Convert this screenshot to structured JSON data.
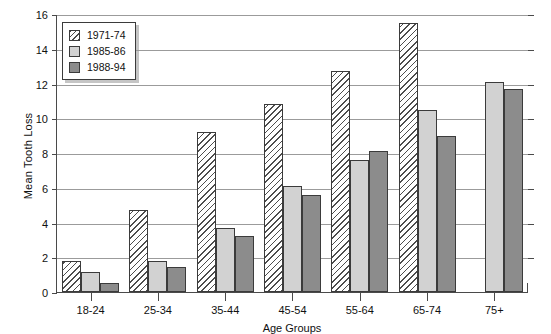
{
  "chart_data": {
    "type": "bar",
    "title": "",
    "xlabel": "Age Groups",
    "ylabel": "Mean Tooth Loss",
    "categories": [
      "18-24",
      "25-34",
      "35-44",
      "45-54",
      "55-64",
      "65-74",
      "75+"
    ],
    "series": [
      {
        "name": "1971-74",
        "color": "#ffffff",
        "pattern": "diagonal-hatch",
        "values": [
          1.8,
          4.7,
          9.2,
          10.8,
          12.7,
          15.5,
          null
        ]
      },
      {
        "name": "1985-86",
        "color": "#d2d2d2",
        "pattern": "solid",
        "values": [
          1.15,
          1.8,
          3.7,
          6.1,
          7.6,
          10.5,
          12.1
        ]
      },
      {
        "name": "1988-94",
        "color": "#8c8c8c",
        "pattern": "solid",
        "values": [
          0.5,
          1.45,
          3.25,
          5.6,
          8.1,
          9.0,
          11.7
        ]
      }
    ],
    "ylim": [
      0,
      16
    ],
    "yticks": [
      0,
      2,
      4,
      6,
      8,
      10,
      12,
      14,
      16
    ],
    "grid": "horizontal",
    "legend_position": "top-left-inside"
  }
}
